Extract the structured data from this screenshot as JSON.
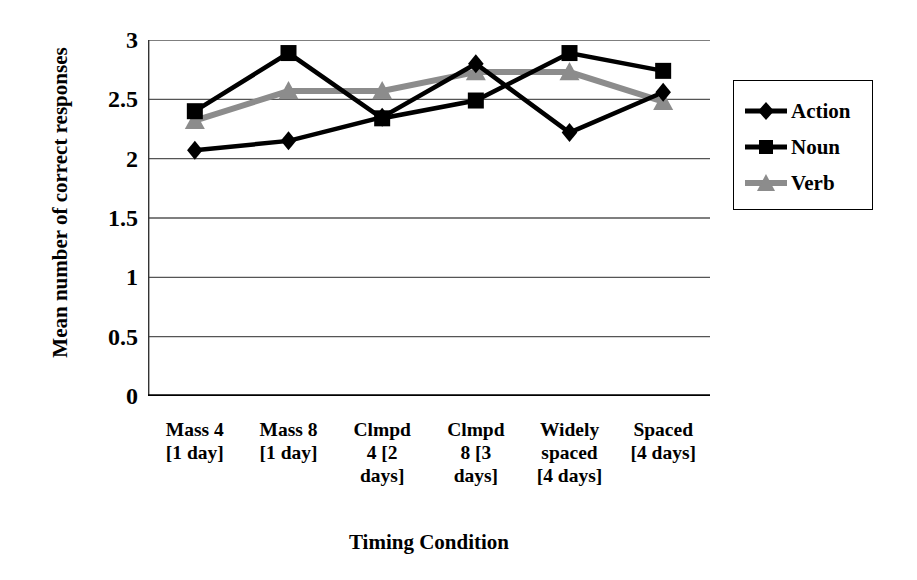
{
  "chart_data": {
    "type": "line",
    "title": "",
    "xlabel": "Timing Condition",
    "ylabel": "Mean number of correct responses",
    "ylim": [
      0,
      3
    ],
    "ytick_values": [
      3,
      2.5,
      2,
      1.5,
      1,
      0.5,
      0
    ],
    "ytick_labels": [
      "3",
      "2.5",
      "2",
      "1.5",
      "1",
      "0.5",
      "0"
    ],
    "grid": true,
    "grid_axis": "y",
    "legend_position": "right",
    "categories": [
      "Mass 4 [1 day]",
      "Mass 8 [1 day]",
      "Clmpd 4 [2 days]",
      "Clmpd 8 [3 days]",
      "Widely spaced [4 days]",
      "Spaced [4 days]"
    ],
    "category_lines": [
      [
        "Mass 4",
        "[1 day]"
      ],
      [
        "Mass 8",
        "[1 day]"
      ],
      [
        "Clmpd",
        "4 [2",
        "days]"
      ],
      [
        "Clmpd",
        "8 [3",
        "days]"
      ],
      [
        "Widely",
        "spaced",
        "[4 days]"
      ],
      [
        "Spaced",
        "[4 days]"
      ]
    ],
    "series": [
      {
        "name": "Action",
        "marker": "diamond",
        "color": "#000000",
        "values": [
          2.07,
          2.15,
          2.35,
          2.8,
          2.22,
          2.56
        ]
      },
      {
        "name": "Noun",
        "marker": "square",
        "color": "#000000",
        "values": [
          2.4,
          2.89,
          2.34,
          2.49,
          2.89,
          2.74
        ]
      },
      {
        "name": "Verb",
        "marker": "triangle",
        "color": "#8c8c8c",
        "values": [
          2.32,
          2.57,
          2.57,
          2.73,
          2.73,
          2.48
        ]
      }
    ]
  },
  "legend": {
    "items": [
      {
        "label": "Action",
        "marker": "diamond-marker-icon",
        "color": "#000000"
      },
      {
        "label": "Noun",
        "marker": "square-marker-icon",
        "color": "#000000"
      },
      {
        "label": "Verb",
        "marker": "triangle-marker-icon",
        "color": "#8c8c8c"
      }
    ]
  }
}
